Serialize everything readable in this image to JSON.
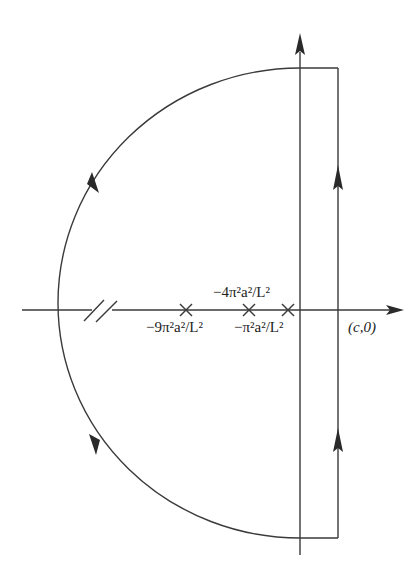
{
  "diagram": {
    "type": "contour-integration-diagram",
    "labels": {
      "pole_1": "−π²a²/L²",
      "pole_2": "−4π²a²/L²",
      "pole_3": "−9π²a²/L²",
      "point_c": "(c,0)"
    },
    "poles": [
      {
        "name": "pole_1",
        "label": "−π²a²/L²",
        "x": 288
      },
      {
        "name": "pole_2",
        "label": "−4π²a²/L²",
        "x": 249
      },
      {
        "name": "pole_3",
        "label": "−9π²a²/L²",
        "x": 186
      }
    ],
    "stroke_color": "#3a3a3a",
    "background_color": "#ffffff"
  }
}
